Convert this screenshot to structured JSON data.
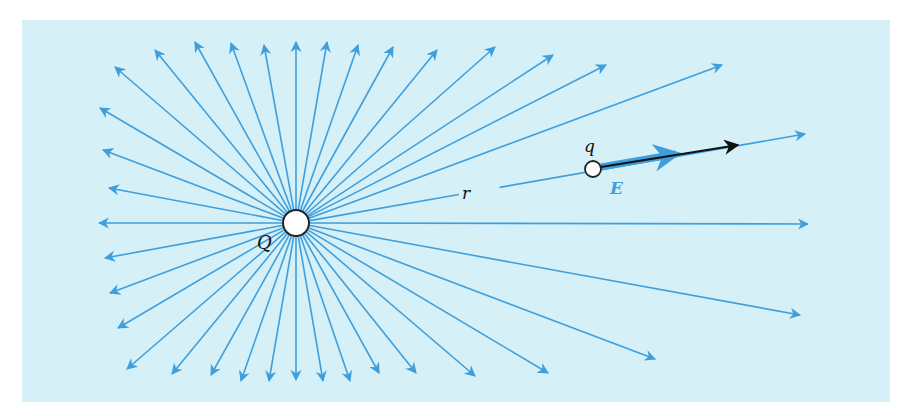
{
  "diagram": {
    "colors": {
      "background": "#d6f0f8",
      "field_line": "#3f9fdc",
      "field_vector_E": "#3f9fdc",
      "force_vector": "#111111",
      "charge_fill": "#ffffff",
      "charge_stroke": "#222222"
    },
    "source_charge": {
      "label": "Q",
      "center": [
        296,
        223
      ],
      "radius": 13
    },
    "test_charge": {
      "label": "q",
      "center": [
        593,
        169
      ],
      "radius": 8
    },
    "labels": {
      "source_charge": "Q",
      "test_charge": "q",
      "distance": "r",
      "field": "E"
    },
    "field_line_tips": [
      [
        100,
        108
      ],
      [
        115,
        67
      ],
      [
        155,
        50
      ],
      [
        195,
        42
      ],
      [
        231,
        43
      ],
      [
        264,
        45
      ],
      [
        296,
        42
      ],
      [
        327,
        42
      ],
      [
        358,
        45
      ],
      [
        393,
        47
      ],
      [
        437,
        50
      ],
      [
        495,
        47
      ],
      [
        553,
        55
      ],
      [
        606,
        65
      ],
      [
        722,
        65
      ],
      [
        805,
        134
      ],
      [
        808,
        224
      ],
      [
        800,
        315
      ],
      [
        655,
        359
      ],
      [
        548,
        373
      ],
      [
        475,
        376
      ],
      [
        416,
        373
      ],
      [
        379,
        373
      ],
      [
        350,
        381
      ],
      [
        323,
        381
      ],
      [
        296,
        380
      ],
      [
        269,
        381
      ],
      [
        241,
        381
      ],
      [
        211,
        375
      ],
      [
        172,
        374
      ],
      [
        127,
        369
      ],
      [
        118,
        328
      ],
      [
        110,
        293
      ],
      [
        105,
        258
      ],
      [
        99,
        223
      ],
      [
        109,
        188
      ],
      [
        103,
        150
      ]
    ],
    "E_vector": {
      "from": [
        601,
        167
      ],
      "to": [
        676,
        154
      ]
    },
    "force_vector": {
      "from": [
        601,
        167
      ],
      "to": [
        738,
        145
      ]
    }
  }
}
